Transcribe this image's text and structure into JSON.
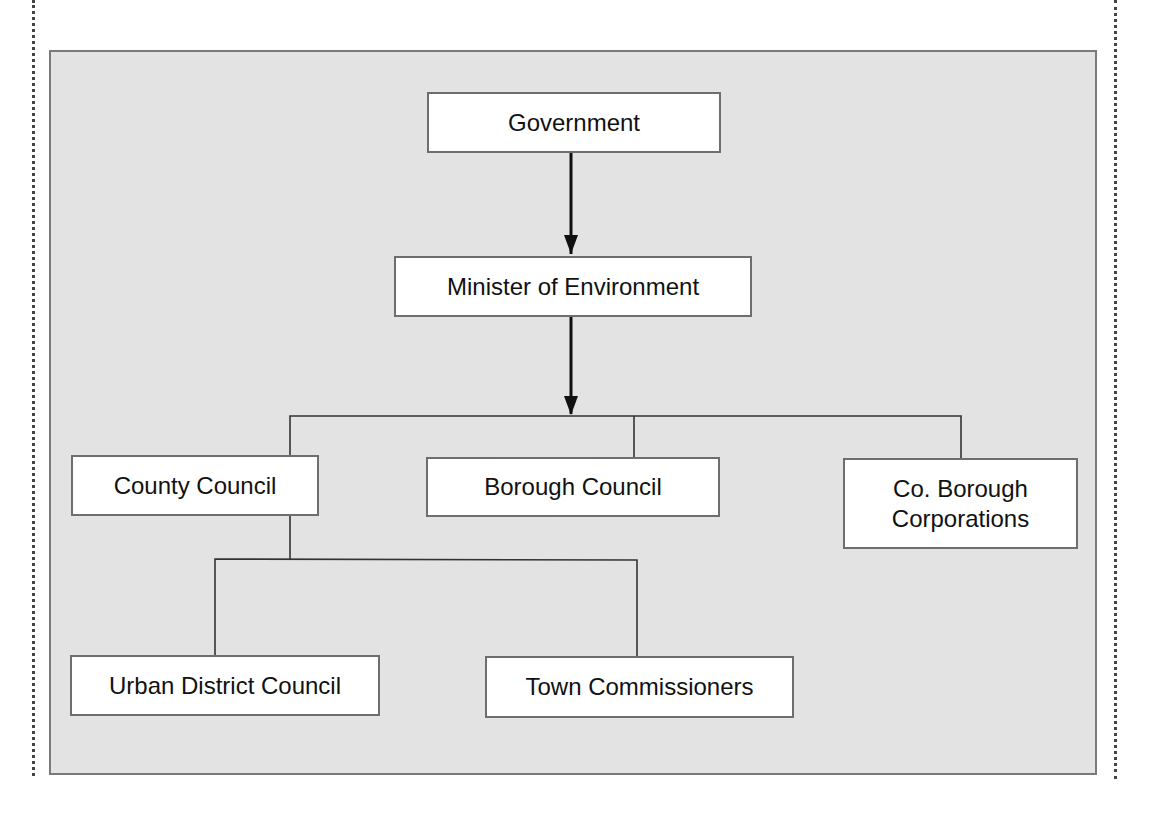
{
  "diagram": {
    "type": "org-chart",
    "nodes": [
      {
        "id": "government",
        "label": "Government"
      },
      {
        "id": "minister",
        "label": "Minister of Environment"
      },
      {
        "id": "county",
        "label": "County Council"
      },
      {
        "id": "borough",
        "label": "Borough Council"
      },
      {
        "id": "co_borough",
        "label": "Co. Borough Corporations"
      },
      {
        "id": "urban",
        "label": "Urban District Council"
      },
      {
        "id": "town",
        "label": "Town Commissioners"
      }
    ],
    "edges": [
      {
        "from": "government",
        "to": "minister",
        "style": "arrow"
      },
      {
        "from": "minister",
        "to": "county",
        "style": "bracket"
      },
      {
        "from": "minister",
        "to": "borough",
        "style": "bracket"
      },
      {
        "from": "minister",
        "to": "co_borough",
        "style": "bracket"
      },
      {
        "from": "county",
        "to": "urban",
        "style": "bracket"
      },
      {
        "from": "county",
        "to": "town",
        "style": "bracket"
      }
    ],
    "colors": {
      "panel_fill": "#e3e3e3",
      "panel_border": "#7a7a7a",
      "node_fill": "#ffffff",
      "line": "#222222"
    }
  }
}
